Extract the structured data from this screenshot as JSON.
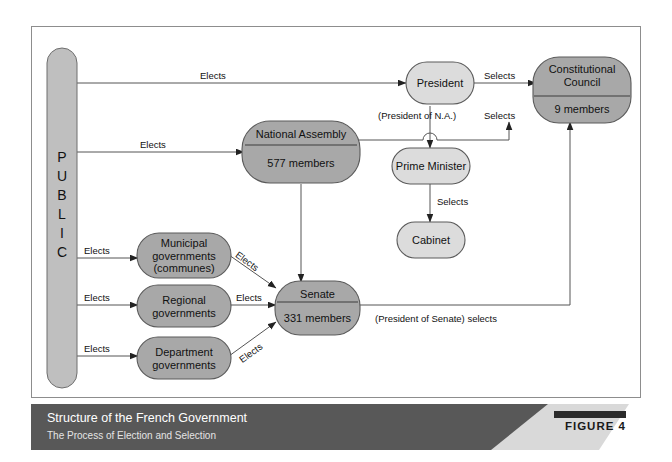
{
  "figure": {
    "columns": [
      {
        "label": "Local Governments"
      },
      {
        "label": "Legislature"
      },
      {
        "label": "Government"
      },
      {
        "label": "Judiciary"
      }
    ],
    "public_bar": {
      "letters": [
        "P",
        "U",
        "B",
        "L",
        "I",
        "C"
      ],
      "text": "PUBLIC"
    },
    "nodes": {
      "president": {
        "label": "President"
      },
      "const_council": {
        "label": "Constitutional\nCouncil",
        "sub": "9 members"
      },
      "nat_assembly": {
        "label": "National Assembly",
        "sub": "577 members"
      },
      "prime_minister": {
        "label": "Prime Minister"
      },
      "cabinet": {
        "label": "Cabinet"
      },
      "municipal": {
        "label": "Municipal\ngovernments\n(communes)"
      },
      "regional": {
        "label": "Regional\ngovernments"
      },
      "department": {
        "label": "Department\ngovernments"
      },
      "senate": {
        "label": "Senate",
        "sub": "331 members"
      }
    },
    "edges": {
      "public_president": "Elects",
      "public_assembly": "Elects",
      "public_municipal": "Elects",
      "public_regional": "Elects",
      "public_department": "Elects",
      "municipal_senate": "Elects",
      "regional_senate": "Elects",
      "department_senate": "Elects",
      "president_council": "Selects",
      "assembly_president_na": "(President of N.A.)",
      "assembly_council": "Selects",
      "pm_cabinet": "Selects",
      "senate_council": "(President of Senate) selects"
    },
    "footer": {
      "title": "Structure of the French Government",
      "subtitle": "The Process of Election and Selection",
      "figure_label": "FIGURE 4"
    },
    "colors": {
      "node_light": "#dcdcdc",
      "node_dark": "#a8a8a8",
      "stroke": "#4a4a4a",
      "footer_bg": "#585858",
      "frame": "#8d8d8d"
    }
  }
}
